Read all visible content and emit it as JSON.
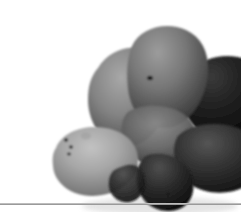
{
  "page": {
    "background_color": "#ffffff",
    "width": 241,
    "height": 212
  },
  "photo": {
    "caption": "Cluster of potatoes",
    "subject": "potatoes",
    "count_visible": 6,
    "treatment": "grayscale photograph",
    "background_color": "#ffffff",
    "bounds": {
      "left": 14,
      "top": 8,
      "right": 228,
      "bottom": 195
    },
    "palette": {
      "highlight": "#b9b9b9",
      "light_mid": "#8e8e8e",
      "mid": "#6a6a6a",
      "dark_mid": "#3d3d3d",
      "dark": "#1e1e1e",
      "deep_shadow": "#0b0b0b",
      "eye_spot": "#141414"
    },
    "items": [
      {
        "name": "top-center-potato",
        "tone": "mid",
        "eye_spots": 1
      },
      {
        "name": "upper-left-potato",
        "tone": "light-mid",
        "eye_spots": 0
      },
      {
        "name": "right-potato",
        "tone": "deep-shadow",
        "eye_spots": 1
      },
      {
        "name": "left-potato",
        "tone": "highlight",
        "eye_spots": 3
      },
      {
        "name": "lower-right-potato",
        "tone": "dark",
        "eye_spots": 0
      },
      {
        "name": "bottom-center-potato",
        "tone": "dark",
        "eye_spots": 1
      }
    ]
  },
  "divider": {
    "label": "horizontal rule",
    "color": "#9a9a9a",
    "highlight_color": "#bdbdbd",
    "top": 203,
    "thickness": 2
  }
}
